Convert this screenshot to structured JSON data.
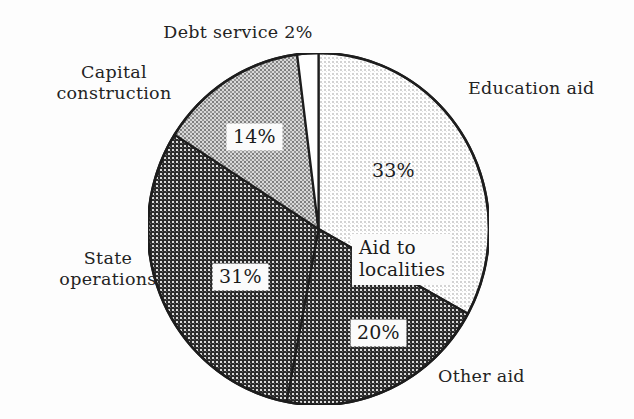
{
  "chart_data": {
    "type": "pie",
    "title": "",
    "subtitle": "",
    "xlabel": "",
    "ylabel": "",
    "legend_position": "none",
    "grid": false,
    "start_angle_deg": 0,
    "direction": "clockwise",
    "units": "percent",
    "categories": [
      "Education aid",
      "Other aid",
      "State operations",
      "Capital construction",
      "Debt service"
    ],
    "values": [
      33,
      20,
      31,
      14,
      2
    ],
    "data_labels": [
      "33%",
      "20%",
      "31%",
      "14%",
      "2%"
    ],
    "group_annotations": [
      {
        "label": "Aid to localities",
        "covers": [
          "Education aid",
          "Other aid"
        ],
        "group_total": 53
      }
    ],
    "slices": [
      {
        "name": "Education aid",
        "value": 33,
        "label": "Education aid",
        "pct_label": "33%",
        "pct_label_boxed": false,
        "fill": "light-dot-grid",
        "fill_color": "#ededed",
        "start_deg": 0.0,
        "end_deg": 118.8
      },
      {
        "name": "Other aid",
        "value": 20,
        "label": "Other aid",
        "pct_label": "20%",
        "pct_label_boxed": true,
        "fill": "dark-checker",
        "fill_color": "#3a3a3a",
        "start_deg": 118.8,
        "end_deg": 190.8
      },
      {
        "name": "State operations",
        "value": 31,
        "label": "State operations",
        "pct_label": "31%",
        "pct_label_boxed": true,
        "fill": "dark-checker",
        "fill_color": "#3a3a3a",
        "start_deg": 190.8,
        "end_deg": 302.4
      },
      {
        "name": "Capital construction",
        "value": 14,
        "label": "Capital construction",
        "pct_label": "14%",
        "pct_label_boxed": true,
        "fill": "medium-checker",
        "fill_color": "#9c9c9c",
        "start_deg": 302.4,
        "end_deg": 352.8
      },
      {
        "name": "Debt service",
        "value": 2,
        "label": "Debt service 2%",
        "pct_label": "2%",
        "pct_label_boxed": false,
        "fill": "solid-white",
        "fill_color": "#ffffff",
        "start_deg": 352.8,
        "end_deg": 360.0
      }
    ]
  },
  "labels": {
    "debt_service": "Debt service 2%",
    "capital_construction": "Capital\nconstruction",
    "education_aid": "Education aid",
    "state_operations": "State\noperations",
    "other_aid": "Other aid",
    "aid_to_localities": "Aid to\nlocalities"
  },
  "percent_labels": {
    "education_aid": "33%",
    "capital_construction": "14%",
    "state_operations": "31%",
    "other_aid": "20%"
  },
  "colors": {
    "background": "#fdfdfd",
    "outline": "#1d1d1d",
    "text": "#232323",
    "education_aid": "#ededed",
    "other_aid": "#3a3a3a",
    "state_operations": "#3a3a3a",
    "capital_construction": "#9c9c9c",
    "debt_service": "#ffffff"
  }
}
